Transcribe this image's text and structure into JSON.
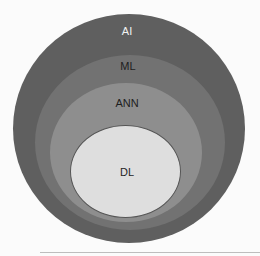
{
  "diagram": {
    "type": "nested-venn",
    "layers": [
      {
        "id": "ai",
        "label": "AI",
        "color": "#5f5f5f"
      },
      {
        "id": "ml",
        "label": "ML",
        "color": "#727272"
      },
      {
        "id": "ann",
        "label": "ANN",
        "color": "#8e8e8e"
      },
      {
        "id": "dl",
        "label": "DL",
        "color": "#dedede"
      }
    ]
  }
}
